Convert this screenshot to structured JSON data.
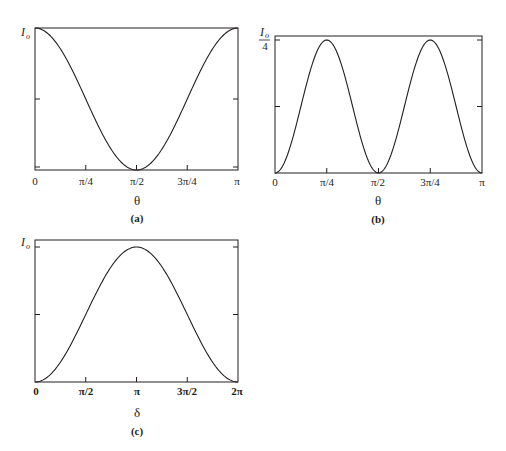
{
  "chart_data": [
    {
      "id": "a",
      "type": "line",
      "panel_label": "(a)",
      "xlabel": "θ",
      "ylabel": "I",
      "ylabel_sub": "o",
      "x_ticks": [
        "0",
        "π/4",
        "π/2",
        "3π/4",
        "π"
      ],
      "x_range": [
        0,
        3.14159
      ],
      "y_ticks": [
        "I_o (top)",
        "I_o/2 (mid, unlabeled)",
        "0 (bottom, unlabeled)"
      ],
      "function": "I = I_o cos²θ",
      "x": [
        0,
        0.3927,
        0.7854,
        1.1781,
        1.5708,
        1.9635,
        2.3562,
        2.7489,
        3.1416
      ],
      "values": [
        1.0,
        0.854,
        0.5,
        0.146,
        0.0,
        0.146,
        0.5,
        0.854,
        1.0
      ],
      "ylim": [
        0,
        1
      ],
      "grid": false
    },
    {
      "id": "b",
      "type": "line",
      "panel_label": "(b)",
      "xlabel": "θ",
      "ylabel": "I",
      "ylabel_sub": "o",
      "ylabel_denominator": "4",
      "x_ticks": [
        "0",
        "π/4",
        "π/2",
        "3π/4",
        "π"
      ],
      "x_range": [
        0,
        3.14159
      ],
      "y_ticks": [
        "I_o/4 (peak)",
        "I_o/8 (mid, unlabeled)"
      ],
      "function": "I = (I_o/4) sin²(2θ)",
      "x": [
        0,
        0.3927,
        0.7854,
        1.1781,
        1.5708,
        1.9635,
        2.3562,
        2.7489,
        3.1416
      ],
      "values": [
        0.0,
        0.125,
        0.25,
        0.125,
        0.0,
        0.125,
        0.25,
        0.125,
        0.0
      ],
      "ylim": [
        0,
        0.258
      ],
      "grid": false
    },
    {
      "id": "c",
      "type": "line",
      "panel_label": "(c)",
      "xlabel": "δ",
      "ylabel": "I",
      "ylabel_sub": "o",
      "x_ticks": [
        "0",
        "π/2",
        "π",
        "3π/2",
        "2π"
      ],
      "x_range": [
        0,
        6.28319
      ],
      "y_ticks": [
        "I_o (peak)",
        "I_o/2 (mid, unlabeled)"
      ],
      "function": "I = I_o sin²(δ/2)",
      "x": [
        0,
        0.7854,
        1.5708,
        2.3562,
        3.1416,
        3.927,
        4.7124,
        5.4978,
        6.2832
      ],
      "values": [
        0.0,
        0.146,
        0.5,
        0.854,
        1.0,
        0.854,
        0.5,
        0.146,
        0.0
      ],
      "ylim": [
        0,
        1.05
      ],
      "grid": false
    }
  ],
  "panels": {
    "a": {
      "ylabel_main": "I",
      "ylabel_sub": "o",
      "xlabel": "θ",
      "caption": "(a)",
      "ticks": [
        "0",
        "π/4",
        "π/2",
        "3π/4",
        "π"
      ]
    },
    "b": {
      "ylabel_main": "I",
      "ylabel_sub": "o",
      "ylabel_den": "4",
      "xlabel": "θ",
      "caption": "(b)",
      "ticks": [
        "0",
        "π/4",
        "π/2",
        "3π/4",
        "π"
      ]
    },
    "c": {
      "ylabel_main": "I",
      "ylabel_sub": "o",
      "xlabel": "δ",
      "caption": "(c)",
      "ticks": [
        "0",
        "π/2",
        "π",
        "3π/2",
        "2π"
      ]
    }
  }
}
